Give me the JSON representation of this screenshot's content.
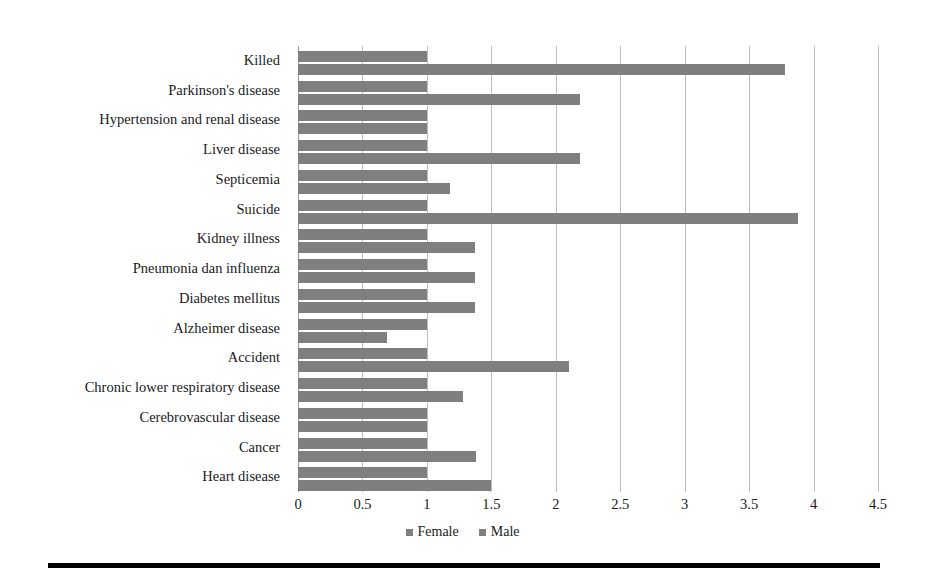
{
  "chart_data": {
    "type": "bar",
    "orientation": "horizontal",
    "title": "",
    "xlabel": "",
    "ylabel": "",
    "xlim": [
      0,
      4.5
    ],
    "xticks": [
      "0",
      "0.5",
      "1",
      "1.5",
      "2",
      "2.5",
      "3",
      "3.5",
      "4",
      "4.5"
    ],
    "xtick_values": [
      0,
      0.5,
      1,
      1.5,
      2,
      2.5,
      3,
      3.5,
      4,
      4.5
    ],
    "grid": true,
    "legend_position": "bottom",
    "bar_color": "#7f7f7f",
    "categories": [
      "Killed",
      "Parkinson's disease",
      "Hypertension and renal disease",
      "Liver disease",
      "Septicemia",
      "Suicide",
      "Kidney illness",
      "Pneumonia dan influenza",
      "Diabetes mellitus",
      "Alzheimer disease",
      "Accident",
      "Chronic lower respiratory disease",
      "Cerebrovascular disease",
      "Cancer",
      "Heart disease"
    ],
    "series": [
      {
        "name": "Female",
        "color": "#7f7f7f",
        "values": [
          1,
          1,
          1,
          1,
          1,
          1,
          1,
          1,
          1,
          1,
          1,
          1,
          1,
          1,
          1
        ]
      },
      {
        "name": "Male",
        "color": "#7f7f7f",
        "values": [
          3.78,
          2.19,
          1.0,
          2.19,
          1.18,
          3.88,
          1.37,
          1.37,
          1.37,
          0.69,
          2.1,
          1.28,
          1.0,
          1.38,
          1.5
        ]
      }
    ]
  },
  "legend": {
    "entries": [
      {
        "label": "Female"
      },
      {
        "label": "Male"
      }
    ]
  }
}
